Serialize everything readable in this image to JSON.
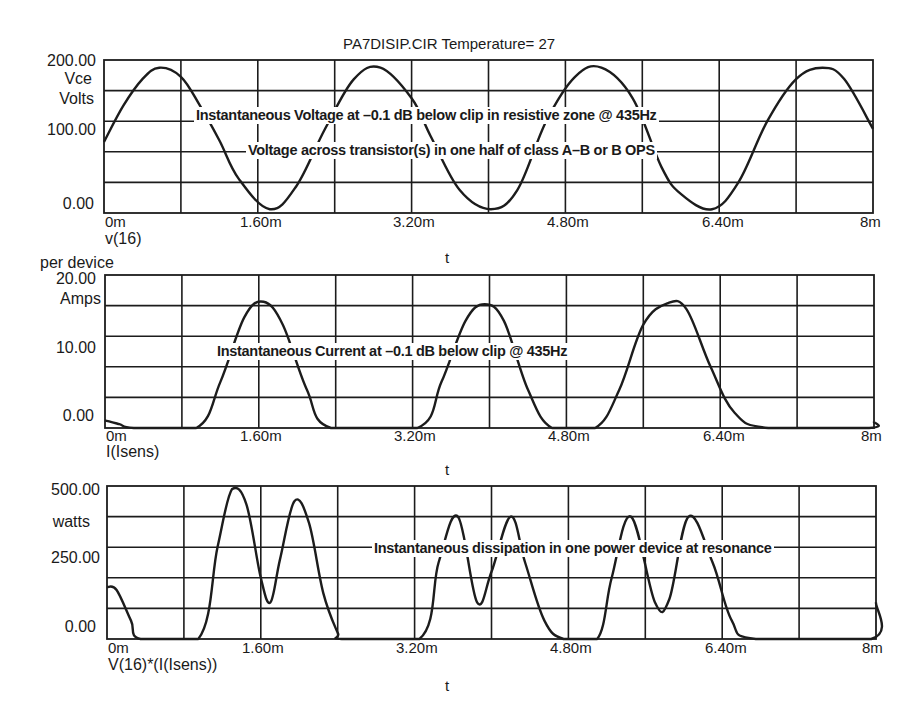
{
  "title": "PA7DISIP.CIR Temperature= 27",
  "chart_data": [
    {
      "type": "line",
      "title": "PA7DISIP.CIR Temperature= 27",
      "trace_label": "v(16)",
      "xlabel": "t",
      "ylabel": [
        "Vce",
        "Volts"
      ],
      "ylim": [
        0,
        200
      ],
      "xlim": [
        0,
        8
      ],
      "x_unit": "ms",
      "yticks": [
        "200.00",
        "100.00",
        "0.00"
      ],
      "xticks": [
        "0m",
        "1.60m",
        "3.20m",
        "4.80m",
        "6.40m",
        "8m"
      ],
      "grid": true,
      "annotations": [
        "Instantaneous Voltage at –0.1 dB below clip in resistive zone @ 435Hz",
        "Voltage across transistor(s) in one half of class A–B or B OPS"
      ],
      "series": [
        {
          "name": "v(16)",
          "description": "Sine, ~435 Hz, offset ~97 V, amplitude ~93 V",
          "x": [
            0,
            0.2,
            0.4,
            0.575,
            0.8,
            1.0,
            1.2,
            1.4,
            1.725,
            2.0,
            2.3,
            2.6,
            2.875,
            3.2,
            3.4,
            3.7,
            4.025,
            4.3,
            4.6,
            4.9,
            5.175,
            5.5,
            5.8,
            6.0,
            6.325,
            6.6,
            6.9,
            7.2,
            7.475,
            7.7,
            8.0
          ],
          "values": [
            93,
            140,
            175,
            190,
            178,
            140,
            95,
            45,
            5,
            35,
            110,
            175,
            190,
            150,
            100,
            30,
            5,
            30,
            120,
            178,
            190,
            150,
            60,
            25,
            5,
            40,
            120,
            175,
            190,
            175,
            110
          ]
        }
      ]
    },
    {
      "type": "line",
      "title": "",
      "trace_label": "I(Isens)",
      "xlabel": "t",
      "ylabel": [
        "per device",
        "Amps"
      ],
      "ylim": [
        0,
        20
      ],
      "xlim": [
        0,
        8
      ],
      "x_unit": "ms",
      "yticks": [
        "20.00",
        "10.00",
        "0.00"
      ],
      "xticks": [
        "0m",
        "1.60m",
        "3.20m",
        "4.80m",
        "6.40m",
        "8m"
      ],
      "grid": true,
      "annotations": [
        "Instantaneous Current at –0.1 dB below clip @ 435Hz"
      ],
      "series": [
        {
          "name": "I(Isens)",
          "description": "Half-wave rectified sine pulses, peak ~16.5 A",
          "x": [
            0,
            0.15,
            0.3,
            0.95,
            1.2,
            1.45,
            1.65,
            1.85,
            2.1,
            2.35,
            3.25,
            3.5,
            3.75,
            3.95,
            4.15,
            4.4,
            4.65,
            5.1,
            5.35,
            5.6,
            5.85,
            6.05,
            6.3,
            6.55,
            6.9,
            7.95,
            8.0
          ],
          "values": [
            1.0,
            0.5,
            0,
            0,
            6,
            14.5,
            16.5,
            13.5,
            5,
            0,
            0,
            6,
            14,
            16.2,
            14,
            5,
            0,
            0,
            5,
            13.5,
            16.3,
            15.5,
            8,
            2,
            0,
            0,
            0.8
          ]
        }
      ]
    },
    {
      "type": "line",
      "title": "",
      "trace_label": "V(16)*(I(Isens))",
      "xlabel": "t",
      "ylabel": [
        "watts"
      ],
      "ylim": [
        0,
        500
      ],
      "xlim": [
        0,
        8
      ],
      "x_unit": "ms",
      "yticks": [
        "500.00",
        "250.00",
        "0.00"
      ],
      "xticks": [
        "0m",
        "1.60m",
        "3.20m",
        "4.80m",
        "6.40m",
        "8m"
      ],
      "grid": true,
      "annotations": [
        "Instantaneous dissipation in one power device at resonance"
      ],
      "series": [
        {
          "name": "V(16)*(I(Isens))",
          "description": "Double-humped dissipation pulses per half-cycle",
          "x": [
            0,
            0.1,
            0.25,
            0.35,
            0.95,
            1.15,
            1.3,
            1.45,
            1.6,
            1.7,
            1.8,
            1.95,
            2.1,
            2.25,
            2.4,
            2.45,
            3.25,
            3.45,
            3.65,
            3.85,
            4.0,
            4.2,
            4.35,
            4.55,
            4.75,
            5.1,
            5.25,
            5.45,
            5.7,
            5.85,
            6.05,
            6.3,
            6.5,
            6.75,
            7.95,
            8.0
          ],
          "values": [
            170,
            160,
            60,
            0,
            0,
            300,
            490,
            440,
            200,
            120,
            260,
            450,
            380,
            150,
            20,
            0,
            0,
            250,
            400,
            120,
            220,
            400,
            250,
            60,
            0,
            0,
            200,
            400,
            120,
            130,
            400,
            250,
            60,
            0,
            0,
            120
          ]
        }
      ]
    }
  ],
  "plots": [
    {
      "ytick_top": "200.00",
      "ytick_mid": "100.00",
      "ytick_bot": "0.00",
      "ylabel_1": "Vce",
      "ylabel_2": "Volts",
      "trace_label": "v(16)",
      "xlabel": "t",
      "annot_1": "Instantaneous Voltage at –0.1 dB below clip in resistive zone @ 435Hz",
      "annot_2": "Voltage across transistor(s) in one half of class A–B or B OPS"
    },
    {
      "ytick_top": "20.00",
      "ytick_mid": "10.00",
      "ytick_bot": "0.00",
      "ylabel_0": "per device",
      "ylabel_1": "Amps",
      "trace_label": "I(Isens)",
      "xlabel": "t",
      "annot_1": "Instantaneous Current at –0.1 dB below clip @ 435Hz"
    },
    {
      "ytick_top": "500.00",
      "ytick_mid": "250.00",
      "ytick_bot": "0.00",
      "ylabel_1": "watts",
      "trace_label": "V(16)*(I(Isens))",
      "xlabel": "t",
      "annot_1": "Instantaneous dissipation in one power device at resonance"
    }
  ],
  "xticks": [
    "0m",
    "1.60m",
    "3.20m",
    "4.80m",
    "6.40m",
    "8m"
  ]
}
